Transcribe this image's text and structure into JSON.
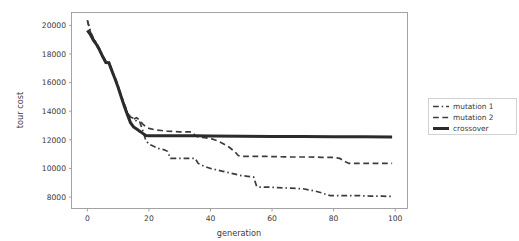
{
  "chart_data": {
    "type": "line",
    "title": "",
    "xlabel": "generation",
    "ylabel": "tour cost",
    "xlim": [
      -5,
      104
    ],
    "ylim": [
      7200,
      20900
    ],
    "grid": false,
    "legend_position": "right-outside",
    "xticks": [
      0,
      20,
      40,
      60,
      80,
      100
    ],
    "xtick_labels": [
      "0",
      "20",
      "40",
      "60",
      "80",
      "100"
    ],
    "yticks": [
      8000,
      10000,
      12000,
      14000,
      16000,
      18000,
      20000
    ],
    "ytick_labels": [
      "8000",
      "10000",
      "12000",
      "14000",
      "16000",
      "18000",
      "20000"
    ],
    "series": [
      {
        "name": "mutation 1",
        "style": "dashdot",
        "color": "#3d3d3d",
        "width": 1.7,
        "x": [
          0,
          1,
          2,
          3,
          4,
          5,
          6,
          7,
          8,
          9,
          10,
          11,
          12,
          13,
          14,
          15,
          16,
          17,
          18,
          19,
          20,
          21,
          22,
          23,
          24,
          25,
          26,
          27,
          28,
          30,
          32,
          34,
          35,
          36,
          38,
          40,
          42,
          44,
          46,
          48,
          50,
          52,
          54,
          55,
          56,
          58,
          60,
          62,
          64,
          66,
          68,
          70,
          72,
          74,
          76,
          78,
          79,
          80,
          82,
          84,
          86,
          88,
          90,
          92,
          94,
          96,
          98,
          99
        ],
        "y": [
          20350,
          19550,
          19100,
          18750,
          18350,
          17900,
          17500,
          17450,
          16900,
          16350,
          15750,
          15100,
          14500,
          13950,
          13600,
          13500,
          13300,
          13250,
          12650,
          11950,
          11700,
          11600,
          11500,
          11400,
          11350,
          11300,
          11200,
          10700,
          10700,
          10700,
          10700,
          10700,
          10700,
          10350,
          10150,
          10000,
          9900,
          9800,
          9700,
          9600,
          9500,
          9450,
          9400,
          8750,
          8700,
          8700,
          8680,
          8660,
          8640,
          8620,
          8600,
          8580,
          8500,
          8420,
          8300,
          8150,
          8100,
          8100,
          8100,
          8100,
          8100,
          8100,
          8080,
          8070,
          8060,
          8060,
          8050,
          8050
        ]
      },
      {
        "name": "mutation 2",
        "style": "dashed",
        "color": "#3d3d3d",
        "width": 1.7,
        "x": [
          0,
          1,
          2,
          3,
          4,
          5,
          6,
          7,
          8,
          9,
          10,
          11,
          12,
          13,
          14,
          15,
          16,
          17,
          18,
          19,
          20,
          22,
          24,
          26,
          28,
          30,
          32,
          34,
          35,
          36,
          38,
          40,
          42,
          44,
          46,
          48,
          49,
          50,
          52,
          54,
          56,
          58,
          60,
          62,
          64,
          66,
          68,
          70,
          72,
          74,
          76,
          78,
          80,
          82,
          84,
          85,
          86,
          88,
          90,
          92,
          94,
          96,
          98,
          99
        ],
        "y": [
          20350,
          19500,
          19050,
          18700,
          18300,
          17850,
          17450,
          17400,
          16850,
          16300,
          15700,
          15050,
          14450,
          13900,
          13500,
          13450,
          13550,
          13350,
          13100,
          12900,
          12800,
          12700,
          12650,
          12600,
          12580,
          12560,
          12560,
          12550,
          12300,
          12200,
          12150,
          12100,
          11950,
          11750,
          11500,
          11150,
          10900,
          10850,
          10850,
          10850,
          10850,
          10850,
          10830,
          10820,
          10810,
          10800,
          10800,
          10800,
          10800,
          10790,
          10780,
          10780,
          10780,
          10700,
          10450,
          10350,
          10350,
          10350,
          10350,
          10350,
          10350,
          10350,
          10350,
          10350
        ]
      },
      {
        "name": "crossover",
        "style": "solid",
        "color": "#2b2b2b",
        "width": 3.0,
        "x": [
          0,
          1,
          2,
          3,
          4,
          5,
          6,
          7,
          8,
          9,
          10,
          11,
          12,
          13,
          14,
          15,
          16,
          17,
          18,
          19,
          20,
          25,
          30,
          35,
          40,
          50,
          60,
          70,
          80,
          90,
          99
        ],
        "y": [
          19650,
          19350,
          18950,
          18650,
          18250,
          17800,
          17400,
          17380,
          16800,
          16250,
          15650,
          15000,
          14350,
          13750,
          13200,
          12900,
          12750,
          12600,
          12450,
          12300,
          12280,
          12280,
          12280,
          12280,
          12260,
          12250,
          12240,
          12230,
          12220,
          12210,
          12200
        ]
      }
    ]
  },
  "legend": {
    "entries": [
      {
        "label": "mutation 1",
        "sample": "dashdot-sample"
      },
      {
        "label": "mutation 2",
        "sample": "dashed-sample"
      },
      {
        "label": "crossover",
        "sample": "solid-sample"
      }
    ]
  }
}
